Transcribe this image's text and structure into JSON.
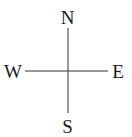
{
  "compass": {
    "labels": {
      "north": "N",
      "east": "E",
      "south": "S",
      "west": "W"
    },
    "line_color": "#333333",
    "text_color": "#1a1a1a"
  }
}
